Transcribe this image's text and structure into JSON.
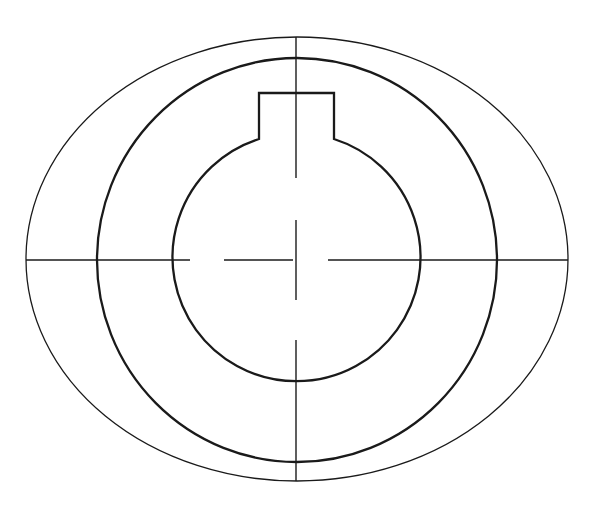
{
  "drawing": {
    "title": "",
    "type": "technical-drawing",
    "description": "Shaft/hub cross-section with keyway, concentric outline and centerlines",
    "stroke_color": "#1a1a1a",
    "background": "#ffffff",
    "center": {
      "x": 296,
      "y": 260
    },
    "outer_ellipse": {
      "cx": 297,
      "cy": 259,
      "rx": 271,
      "ry": 222
    },
    "middle_circle": {
      "cx": 297,
      "cy": 260,
      "rx": 200,
      "ry": 202
    },
    "inner_circle_with_keyway": {
      "cx": 296,
      "cy": 260,
      "r": 124,
      "keyway": {
        "left_x": 259,
        "right_x": 334,
        "top_y": 93
      }
    },
    "centerlines": {
      "horizontal_y": 260,
      "vertical_x": 296
    }
  }
}
